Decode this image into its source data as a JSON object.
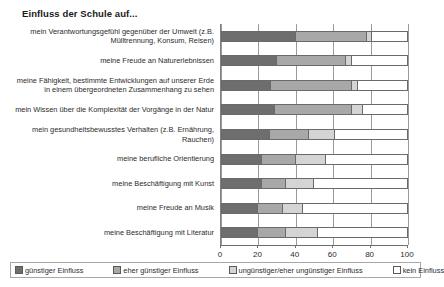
{
  "chart_data": {
    "type": "bar",
    "orientation": "horizontal",
    "stacked": true,
    "title": "Einfluss der Schule auf...",
    "xlabel": "",
    "ylabel": "",
    "xlim": [
      0,
      100
    ],
    "xticks": [
      0,
      20,
      40,
      60,
      80,
      100
    ],
    "xtick_labels": [
      "0",
      "20",
      "40",
      "60",
      "80",
      "100"
    ],
    "grid": true,
    "legend_position": "bottom",
    "categories": [
      "mein Verantwortungsgefühl gegenüber der Umwelt (z.B. Mülltrennung, Konsum, Reisen)",
      "meine Freude an Naturerlebnissen",
      "meine Fähigkeit, bestimmte Entwicklungen auf unserer Erde in einem übergeordneten Zusammenhang zu sehen",
      "mein Wissen über die Komplexität der Vorgänge in der Natur",
      "mein gesundheitsbewusstes Verhalten (z.B. Ernährung, Rauchen)",
      "meine berufliche Orientierung",
      "meine Beschäftigung mit Kunst",
      "meine Freude an Musik",
      "meine Beschäftigung mit Literatur"
    ],
    "series": [
      {
        "name": "günstiger Einfluss",
        "color": "#6e6e6e",
        "values": [
          40,
          30,
          27,
          29,
          26,
          22,
          22,
          20,
          20
        ]
      },
      {
        "name": "eher günstiger Einfluss",
        "color": "#a8a8a8",
        "values": [
          38,
          37,
          43,
          41,
          21,
          18,
          13,
          13,
          15
        ]
      },
      {
        "name": "ungünstiger/eher ungünstiger Einfluss",
        "color": "#d4d4d4",
        "values": [
          3,
          3,
          3,
          6,
          14,
          16,
          15,
          11,
          17
        ]
      },
      {
        "name": "kein Einfluss",
        "color": "#ffffff",
        "values": [
          19,
          30,
          27,
          24,
          39,
          44,
          50,
          56,
          48
        ]
      }
    ]
  },
  "legend": {
    "items": [
      "günstiger Einfluss",
      "eher günstiger Einfluss",
      "ungünstiger/eher ungünstiger Einfluss",
      "kein Einfluss"
    ]
  }
}
